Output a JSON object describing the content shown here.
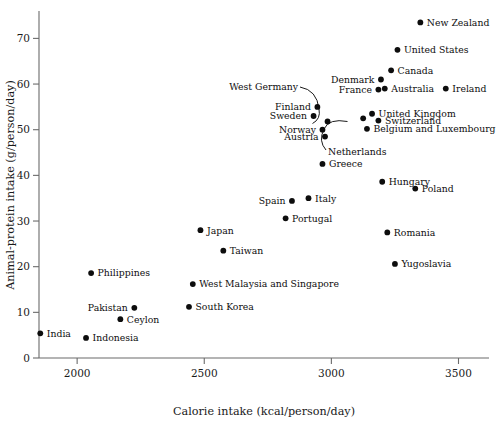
{
  "chart_data": {
    "type": "scatter",
    "title": "",
    "xlabel": "Calorie intake (kcal/person/day)",
    "ylabel": "Animal-protein intake (g/person/day)",
    "xlim": [
      1850,
      3620
    ],
    "ylim": [
      0,
      76
    ],
    "xticks": [
      2000,
      2500,
      3000,
      3500
    ],
    "yticks": [
      0,
      10,
      20,
      30,
      40,
      50,
      60,
      70
    ],
    "grid": false,
    "legend": "none",
    "marker_color": "#0d0d0d",
    "axis_color": "#6b6b6b",
    "points": [
      {
        "name": "New Zealand",
        "x": 3350,
        "y": 73.5,
        "label_side": "right"
      },
      {
        "name": "United States",
        "x": 3260,
        "y": 67.5,
        "label_side": "right"
      },
      {
        "name": "Canada",
        "x": 3235,
        "y": 63.0,
        "label_side": "right"
      },
      {
        "name": "Denmark",
        "x": 3195,
        "y": 61.0,
        "label_side": "left"
      },
      {
        "name": "Australia",
        "x": 3210,
        "y": 59.0,
        "label_side": "right"
      },
      {
        "name": "France",
        "x": 3185,
        "y": 58.8,
        "label_side": "left"
      },
      {
        "name": "Ireland",
        "x": 3450,
        "y": 59.0,
        "label_side": "right"
      },
      {
        "name": "Finland",
        "x": 2945,
        "y": 55.0,
        "label_side": "left"
      },
      {
        "name": "Sweden",
        "x": 2930,
        "y": 53.0,
        "label_side": "left"
      },
      {
        "name": "United Kingdom",
        "x": 3160,
        "y": 53.5,
        "label_side": "right"
      },
      {
        "name": "Switzerland",
        "x": 3185,
        "y": 52.0,
        "label_side": "right"
      },
      {
        "name": "West Germany",
        "x": 2985,
        "y": 51.8,
        "label_side": "leader-left"
      },
      {
        "name": "Netherlands",
        "x": 3125,
        "y": 52.5,
        "label_side": "leader-down"
      },
      {
        "name": "Belgium and Luxembourg",
        "x": 3140,
        "y": 50.2,
        "label_side": "right"
      },
      {
        "name": "Norway",
        "x": 2965,
        "y": 50.0,
        "label_side": "left"
      },
      {
        "name": "Austria",
        "x": 2975,
        "y": 48.5,
        "label_side": "left"
      },
      {
        "name": "Greece",
        "x": 2965,
        "y": 42.5,
        "label_side": "right"
      },
      {
        "name": "Hungary",
        "x": 3200,
        "y": 38.6,
        "label_side": "right"
      },
      {
        "name": "Poland",
        "x": 3330,
        "y": 37.1,
        "label_side": "right"
      },
      {
        "name": "Italy",
        "x": 2910,
        "y": 35.0,
        "label_side": "right"
      },
      {
        "name": "Spain",
        "x": 2845,
        "y": 34.4,
        "label_side": "left"
      },
      {
        "name": "Portugal",
        "x": 2820,
        "y": 30.6,
        "label_side": "right"
      },
      {
        "name": "Romania",
        "x": 3220,
        "y": 27.5,
        "label_side": "right"
      },
      {
        "name": "Japan",
        "x": 2485,
        "y": 28.0,
        "label_side": "right"
      },
      {
        "name": "Taiwan",
        "x": 2575,
        "y": 23.5,
        "label_side": "right"
      },
      {
        "name": "Yugoslavia",
        "x": 3250,
        "y": 20.6,
        "label_side": "right"
      },
      {
        "name": "Philippines",
        "x": 2055,
        "y": 18.6,
        "label_side": "right"
      },
      {
        "name": "West Malaysia and Singapore",
        "x": 2455,
        "y": 16.2,
        "label_side": "right"
      },
      {
        "name": "Pakistan",
        "x": 2225,
        "y": 11.0,
        "label_side": "left"
      },
      {
        "name": "South Korea",
        "x": 2440,
        "y": 11.2,
        "label_side": "right"
      },
      {
        "name": "Ceylon",
        "x": 2170,
        "y": 8.5,
        "label_side": "right"
      },
      {
        "name": "India",
        "x": 1855,
        "y": 5.4,
        "label_side": "right"
      },
      {
        "name": "Indonesia",
        "x": 2035,
        "y": 4.4,
        "label_side": "right"
      }
    ]
  }
}
